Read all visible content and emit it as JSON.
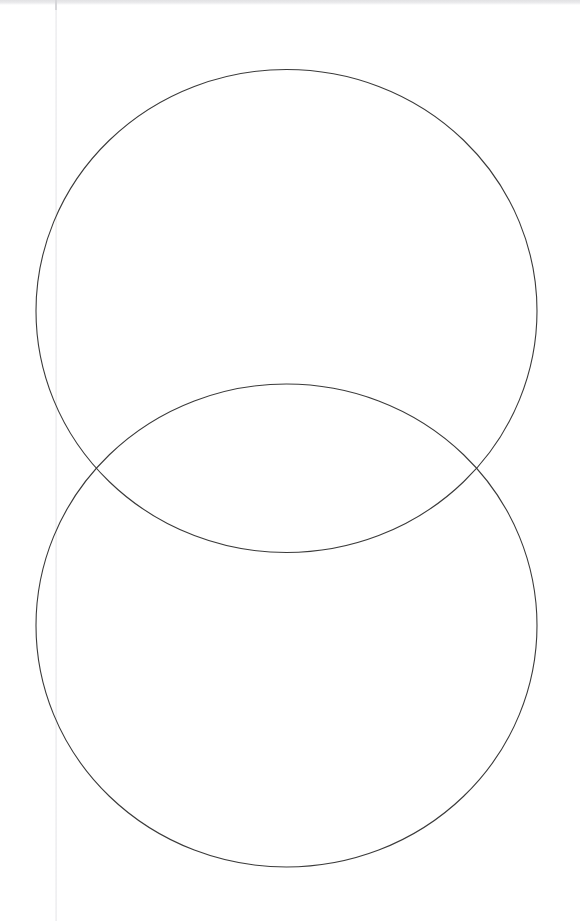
{
  "page": {
    "width": 580,
    "height": 921,
    "background_color": "#ffffff",
    "scan_top_band_color": "#e4e4e6",
    "margin_rule_color": "#e8e8ea",
    "margin_rule_x": 55
  },
  "figure": {
    "name": "two-overlapping-circles",
    "stroke_color": "#3a3a3a",
    "stroke_width": 1.1,
    "fill": "none"
  },
  "chart_data": {
    "type": "diagram",
    "subtype": "venn",
    "xlabel": "",
    "ylabel": "",
    "grid": false,
    "legend": "none",
    "xlim": [
      0,
      580
    ],
    "ylim": [
      0,
      921
    ],
    "shapes": [
      {
        "name": "upper-circle",
        "type": "ellipse",
        "cx": 286.5,
        "cy": 311,
        "rx": 250.5,
        "ry": 241.5,
        "stroke": "#3a3a3a",
        "stroke_width": 1.1,
        "fill": "none",
        "bounds": {
          "left": 36,
          "top": 69.5,
          "right": 537,
          "bottom": 552.5
        }
      },
      {
        "name": "lower-circle",
        "type": "ellipse",
        "cx": 286.5,
        "cy": 625.5,
        "rx": 250.5,
        "ry": 241.5,
        "stroke": "#3a3a3a",
        "stroke_width": 1.1,
        "fill": "none",
        "bounds": {
          "left": 36,
          "top": 384,
          "right": 537,
          "bottom": 867
        }
      }
    ],
    "intersections": [
      {
        "name": "left-intersection",
        "x": 92,
        "y": 468
      },
      {
        "name": "right-intersection",
        "x": 481,
        "y": 468
      }
    ],
    "annotations": []
  }
}
